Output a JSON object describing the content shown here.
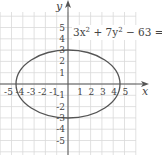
{
  "figure": {
    "equation": "3x² + 7y² − 63 = 0",
    "equation_parts": {
      "a": "3x",
      "exp1": "2",
      "b": " + 7y",
      "exp2": "2",
      "c": " − 63 = 0"
    },
    "x_axis_label": "x",
    "y_axis_label": "y",
    "x_ticks": [
      "-5",
      "-4",
      "-3",
      "-2",
      "-1",
      "1",
      "2",
      "3",
      "4",
      "5"
    ],
    "y_ticks": [
      "5",
      "4",
      "3",
      "2",
      "1",
      "-1",
      "-2",
      "-3",
      "-4",
      "-5"
    ],
    "curve_color": "#555555",
    "grid_color": "#d8d8d8",
    "axis_color": "#555555"
  },
  "chart_data": {
    "type": "line",
    "xlabel": "x",
    "ylabel": "y",
    "xlim": [
      -6,
      6.5
    ],
    "ylim": [
      -6,
      6.5
    ],
    "grid": true,
    "series": [
      {
        "name": "ellipse 3x² + 7y² = 63",
        "center": [
          0,
          0
        ],
        "semi_major_x": 4.583,
        "semi_minor_y": 3,
        "intercepts": {
          "x": [
            -4.583,
            4.583
          ],
          "y": [
            -3,
            3
          ]
        }
      }
    ]
  }
}
